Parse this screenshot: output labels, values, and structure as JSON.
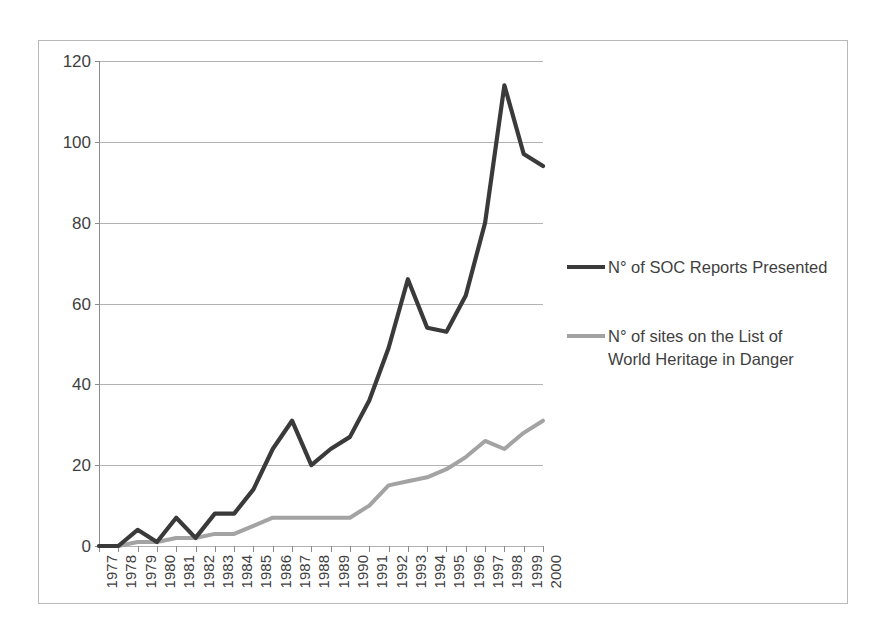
{
  "chart_data": {
    "type": "line",
    "title": "",
    "xlabel": "",
    "ylabel": "",
    "ylim": [
      0,
      120
    ],
    "yticks": [
      0,
      20,
      40,
      60,
      80,
      100,
      120
    ],
    "grid": true,
    "legend_position": "right",
    "categories": [
      "1977",
      "1978",
      "1979",
      "1980",
      "1981",
      "1982",
      "1983",
      "1984",
      "1985",
      "1986",
      "1987",
      "1988",
      "1989",
      "1990",
      "1991",
      "1992",
      "1993",
      "1994",
      "1995",
      "1996",
      "1997",
      "1998",
      "1999",
      "2000"
    ],
    "series": [
      {
        "name": "N° of SOC Reports Presented",
        "color": "#3a3a3a",
        "values": [
          0,
          0,
          4,
          1,
          7,
          2,
          8,
          8,
          14,
          24,
          31,
          20,
          24,
          27,
          36,
          49,
          66,
          54,
          53,
          62,
          80,
          114,
          97,
          94
        ]
      },
      {
        "name": "N° of sites on the List of\nWorld Heritage in Danger",
        "color": "#a3a3a3",
        "values": [
          0,
          0,
          1,
          1,
          2,
          2,
          3,
          3,
          5,
          7,
          7,
          7,
          7,
          7,
          10,
          15,
          16,
          17,
          19,
          22,
          26,
          24,
          28,
          31
        ]
      }
    ]
  },
  "legend": {
    "entries": [
      {
        "label": "N° of SOC Reports Presented",
        "color": "#3a3a3a"
      },
      {
        "label": "N° of sites on the List of\nWorld Heritage in Danger",
        "color": "#a3a3a3"
      }
    ]
  },
  "colors": {
    "series_dark": "#3a3a3a",
    "series_gray": "#a3a3a3",
    "gridline": "#b2b2b2",
    "axis": "#8c8c8c",
    "border": "#b9b9b9",
    "text": "#3f3f3f",
    "background": "#ffffff"
  }
}
